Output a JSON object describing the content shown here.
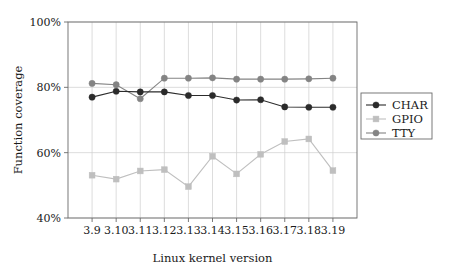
{
  "chart_data": {
    "type": "line",
    "title": "",
    "xlabel": "Linux kernel version",
    "ylabel": "Function coverage",
    "categories": [
      "3.9",
      "3.10",
      "3.11",
      "3.12",
      "3.13",
      "3.14",
      "3.15",
      "3.16",
      "3.17",
      "3.18",
      "3.19"
    ],
    "ytick_labels": [
      "40%",
      "60%",
      "80%",
      "100%"
    ],
    "ytick_values": [
      40,
      60,
      80,
      100
    ],
    "ylim": [
      40,
      100
    ],
    "grid": "both",
    "legend_position": "right-outside",
    "series": [
      {
        "name": "CHAR",
        "color": "#2b2b2b",
        "marker": "circle",
        "values": [
          77.0,
          78.8,
          78.6,
          78.6,
          77.5,
          77.5,
          76.1,
          76.2,
          74.0,
          73.9,
          73.9
        ]
      },
      {
        "name": "GPIO",
        "color": "#bfbfbf",
        "marker": "square",
        "values": [
          53.1,
          51.9,
          54.4,
          54.8,
          49.6,
          58.9,
          53.5,
          59.5,
          63.4,
          64.2,
          54.5
        ]
      },
      {
        "name": "TTY",
        "color": "#848484",
        "marker": "circle",
        "values": [
          81.2,
          80.8,
          76.5,
          82.8,
          82.8,
          82.9,
          82.5,
          82.5,
          82.5,
          82.6,
          82.8
        ]
      }
    ]
  },
  "legend": {
    "entries": [
      {
        "label": "CHAR"
      },
      {
        "label": "GPIO"
      },
      {
        "label": "TTY"
      }
    ]
  },
  "axes": {
    "x_title": "Linux kernel version",
    "y_title": "Function coverage"
  }
}
